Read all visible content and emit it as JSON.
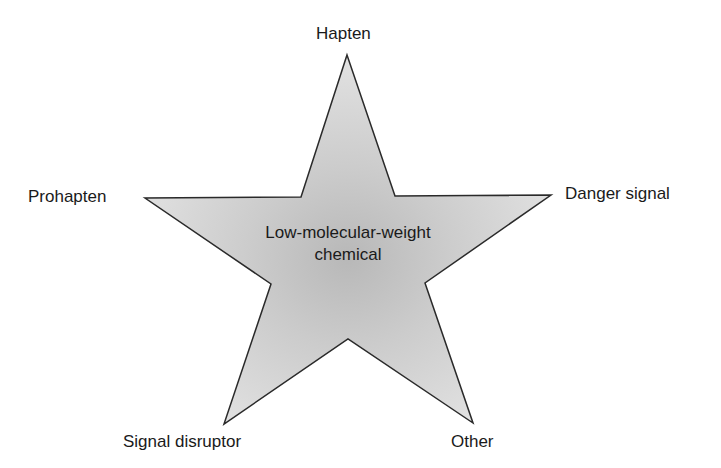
{
  "diagram": {
    "center_label": {
      "line1": "Low-molecular-weight",
      "line2": "chemical"
    },
    "points": [
      {
        "id": "top",
        "label": "Hapten"
      },
      {
        "id": "right",
        "label": "Danger signal"
      },
      {
        "id": "bottom-right",
        "label": "Other"
      },
      {
        "id": "bottom-left",
        "label": "Signal disruptor"
      },
      {
        "id": "left",
        "label": "Prohapten"
      }
    ],
    "colors": {
      "fill_outer": "#dcdcdc",
      "fill_inner": "#b5b5b5",
      "stroke": "#2a2a2a"
    }
  }
}
